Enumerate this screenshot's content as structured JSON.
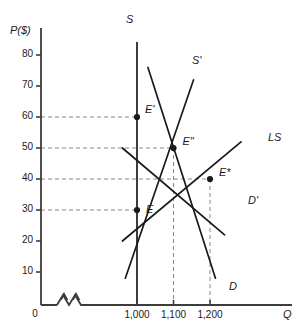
{
  "chart_data": {
    "type": "line",
    "title": "",
    "xlabel": "Q",
    "ylabel": "P($)",
    "grid": false,
    "legend_position": "inline-curve-labels",
    "xlim": [
      950,
      1300
    ],
    "ylim": [
      0,
      85
    ],
    "y_ticks": [
      10,
      20,
      30,
      40,
      50,
      60,
      70,
      80
    ],
    "y_tick_labels": [
      "10",
      "20",
      "30",
      "40",
      "50",
      "60",
      "70",
      "80"
    ],
    "x_ticks": [
      1000,
      1100,
      1200
    ],
    "x_tick_labels": [
      "1,000",
      "1,100",
      "1,200"
    ],
    "axis_break": true,
    "origin_label": "0",
    "series": [
      {
        "name": "S",
        "label": "S",
        "role": "short-run-supply",
        "style": "solid",
        "points": [
          [
            1000,
            0
          ],
          [
            1000,
            84
          ]
        ]
      },
      {
        "name": "S'",
        "label": "S'",
        "role": "shifted-supply",
        "style": "solid",
        "points": [
          [
            968,
            8
          ],
          [
            1155,
            72
          ]
        ]
      },
      {
        "name": "LS",
        "label": "LS",
        "role": "long-run-supply",
        "style": "solid",
        "points": [
          [
            960,
            20
          ],
          [
            1285,
            52
          ]
        ]
      },
      {
        "name": "D",
        "label": "D",
        "role": "original-demand",
        "style": "solid",
        "points": [
          [
            1030,
            76
          ],
          [
            1215,
            8
          ]
        ]
      },
      {
        "name": "D'",
        "label": "D'",
        "role": "shifted-demand",
        "style": "solid",
        "points": [
          [
            960,
            50
          ],
          [
            1240,
            22
          ]
        ]
      }
    ],
    "equilibria": [
      {
        "label": "E",
        "x": 1000,
        "y": 30,
        "price": 30,
        "quantity": 1000,
        "marker": "filled-circle"
      },
      {
        "label": "E'",
        "x": 1000,
        "y": 60,
        "price": 60,
        "quantity": 1000,
        "marker": "filled-circle"
      },
      {
        "label": "E\"",
        "x": 1100,
        "y": 50,
        "price": 50,
        "quantity": 1100,
        "marker": "filled-circle"
      },
      {
        "label": "E*",
        "x": 1200,
        "y": 40,
        "price": 40,
        "quantity": 1200,
        "marker": "filled-circle"
      }
    ],
    "guide_lines": [
      {
        "type": "horizontal",
        "value": 60,
        "from_x": 1000,
        "note": "dashed price guide to E'"
      },
      {
        "type": "horizontal",
        "value": 50,
        "from_x": 1100,
        "note": "dashed price guide to E\""
      },
      {
        "type": "horizontal",
        "value": 40,
        "from_x": 1200,
        "note": "dashed price guide to E*"
      },
      {
        "type": "horizontal",
        "value": 30,
        "from_x": 1000,
        "note": "dashed price guide to E"
      },
      {
        "type": "vertical",
        "value": 1100,
        "from_y": 50,
        "note": "dashed quantity guide to E\""
      },
      {
        "type": "vertical",
        "value": 1200,
        "from_y": 40,
        "note": "dashed quantity guide to E*"
      }
    ],
    "colors": {
      "axis": "#3c3c3c",
      "curve": "#1a1a1a",
      "dashed": "#8a8a8a",
      "text": "#1a1a1a",
      "background": "#ffffff"
    }
  }
}
